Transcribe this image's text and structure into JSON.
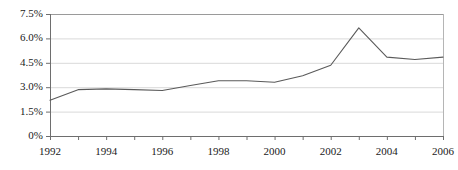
{
  "chart_data": {
    "type": "line",
    "title": "",
    "subtitle": "",
    "xlabel": "",
    "ylabel": "",
    "x": [
      1992,
      1993,
      1994,
      1995,
      1996,
      1997,
      1998,
      1999,
      2000,
      2001,
      2002,
      2003,
      2004,
      2005,
      2006
    ],
    "values": [
      2.2,
      2.85,
      2.9,
      2.85,
      2.8,
      3.1,
      3.4,
      3.4,
      3.3,
      3.7,
      4.35,
      6.65,
      4.85,
      4.7,
      4.85
    ],
    "series": [
      {
        "name": "",
        "values": [
          2.2,
          2.85,
          2.9,
          2.85,
          2.8,
          3.1,
          3.4,
          3.4,
          3.3,
          3.7,
          4.35,
          6.65,
          4.85,
          4.7,
          4.85
        ]
      }
    ],
    "xlim": [
      1992,
      2006
    ],
    "ylim": [
      0,
      7.5
    ],
    "ytick_values": [
      7.5,
      6.0,
      4.5,
      3.0,
      1.5,
      0
    ],
    "ytick_labels": [
      "7.5%",
      "6.0%",
      "4.5%",
      "3.0%",
      "1.5%",
      "0%"
    ],
    "xtick_values": [
      1992,
      1993,
      1994,
      1995,
      1996,
      1997,
      1998,
      1999,
      2000,
      2001,
      2002,
      2003,
      2004,
      2005,
      2006
    ],
    "xtick_labels": [
      "1992",
      "",
      "1994",
      "",
      "1996",
      "",
      "1998",
      "",
      "2000",
      "",
      "2002",
      "",
      "2004",
      "",
      "2006"
    ],
    "grid": true,
    "grid_axis": "y",
    "legend": false,
    "legend_position": "none",
    "annotations": [],
    "colors": {
      "line": "#5a5a5a",
      "grid": "#d9d9d9",
      "axis": "#808080",
      "text": "#1a1a1a",
      "background": "#ffffff"
    }
  },
  "axis_labels": {
    "y": [
      {
        "text": "7.5%",
        "value": 7.5
      },
      {
        "text": "6.0%",
        "value": 6.0
      },
      {
        "text": "4.5%",
        "value": 4.5
      },
      {
        "text": "3.0%",
        "value": 3.0
      },
      {
        "text": "1.5%",
        "value": 1.5
      },
      {
        "text": "0%",
        "value": 0
      }
    ],
    "x": [
      {
        "text": "1992",
        "value": 1992
      },
      {
        "text": "1994",
        "value": 1994
      },
      {
        "text": "1996",
        "value": 1996
      },
      {
        "text": "1998",
        "value": 1998
      },
      {
        "text": "2000",
        "value": 2000
      },
      {
        "text": "2002",
        "value": 2002
      },
      {
        "text": "2004",
        "value": 2004
      },
      {
        "text": "2006",
        "value": 2006
      }
    ]
  }
}
